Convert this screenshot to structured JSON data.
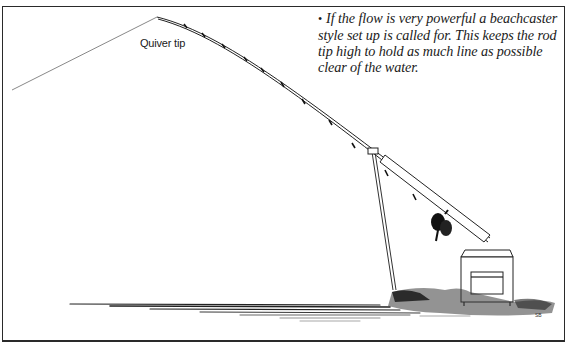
{
  "figure": {
    "caption_bullet": "•",
    "caption_text": "If the flow is very powerful a beachcaster style set up is called for. This keeps the rod tip high to hold as much line as possible clear of the water.",
    "labels": {
      "quiver_tip": "Quiver tip"
    },
    "artist_signature": "SB",
    "colors": {
      "ink": "#1a1a1a",
      "background": "#ffffff",
      "border": "#2a2a2a"
    },
    "elements": [
      "fishing-line",
      "quiver-tip",
      "rod",
      "rod-rings",
      "reel",
      "rod-rest",
      "tackle-box",
      "grass-bank",
      "water"
    ]
  }
}
